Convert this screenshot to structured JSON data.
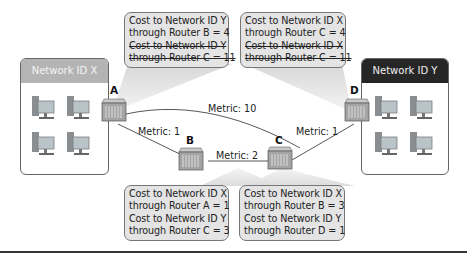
{
  "networks": {
    "x": {
      "label": "Network ID X",
      "header_color": "#b4b4b4"
    },
    "y": {
      "label": "Network ID Y",
      "header_color": "#262626"
    }
  },
  "routers": [
    {
      "id": "A",
      "label": "A"
    },
    {
      "id": "B",
      "label": "B"
    },
    {
      "id": "C",
      "label": "C"
    },
    {
      "id": "D",
      "label": "D"
    }
  ],
  "links": [
    {
      "from": "A",
      "to": "B",
      "label": "Metric: 1"
    },
    {
      "from": "A",
      "to": "C",
      "label": "Metric: 10"
    },
    {
      "from": "B",
      "to": "C",
      "label": "Metric: 2"
    },
    {
      "from": "C",
      "to": "D",
      "label": "Metric: 1"
    }
  ],
  "callouts": {
    "A": {
      "lines": [
        "Cost to Network ID Y",
        "through Router B = 4",
        "Cost to Network ID Y",
        "through Router C = 11"
      ],
      "struck": [
        false,
        false,
        true,
        true
      ]
    },
    "D": {
      "lines": [
        "Cost to Network ID X",
        "through Router C = 4",
        "Cost to Network ID X",
        "through Router C = 11"
      ],
      "struck": [
        false,
        false,
        true,
        true
      ]
    },
    "B": {
      "lines": [
        "Cost to Network ID X",
        "through Router A = 1",
        "Cost to Network ID Y",
        "through Router C = 3"
      ]
    },
    "C": {
      "lines": [
        "Cost to Network ID X",
        "through Router B = 3",
        "Cost to Network ID Y",
        "through Router D = 1"
      ]
    }
  }
}
